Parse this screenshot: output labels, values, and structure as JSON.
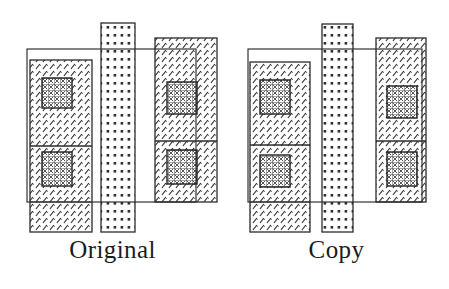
{
  "figure": {
    "title": "",
    "background_color": "#ffffff",
    "line_color": "#2b2b2b",
    "hatch_color": "#3a3a3a",
    "panels": [
      {
        "id": "original",
        "caption": "Original",
        "shapes": [
          {
            "name": "outline-rectangle",
            "x": 27,
            "y": 49,
            "w": 169,
            "h": 153,
            "fill": "none"
          },
          {
            "name": "left-hatched-column",
            "x": 30,
            "y": 60,
            "w": 62,
            "h": 172,
            "texture": "diagonal-slash"
          },
          {
            "name": "left-divider-line",
            "x1": 30,
            "y1": 146,
            "x2": 92,
            "y2": 146
          },
          {
            "name": "left-inner-crosshatch-box-upper",
            "x": 42,
            "y": 78,
            "w": 30,
            "h": 30,
            "texture": "cross-grid"
          },
          {
            "name": "left-inner-crosshatch-box-lower",
            "x": 42,
            "y": 152,
            "w": 30,
            "h": 34,
            "texture": "cross-grid"
          },
          {
            "name": "middle-dotted-column",
            "x": 101,
            "y": 23,
            "w": 34,
            "h": 209,
            "texture": "dot-grid"
          },
          {
            "name": "right-hatched-column",
            "x": 155,
            "y": 38,
            "w": 62,
            "h": 164,
            "texture": "diagonal-slash"
          },
          {
            "name": "right-divider-line",
            "x1": 155,
            "y1": 141,
            "x2": 217,
            "y2": 141
          },
          {
            "name": "right-inner-crosshatch-box-upper",
            "x": 167,
            "y": 82,
            "w": 30,
            "h": 32,
            "texture": "cross-grid"
          },
          {
            "name": "right-inner-crosshatch-box-lower",
            "x": 167,
            "y": 150,
            "w": 30,
            "h": 34,
            "texture": "cross-grid"
          }
        ]
      },
      {
        "id": "copy",
        "caption": "Copy",
        "shapes": [
          {
            "name": "outline-rectangle",
            "x": 24,
            "y": 49,
            "w": 174,
            "h": 153,
            "fill": "none"
          },
          {
            "name": "left-hatched-column",
            "x": 26,
            "y": 62,
            "w": 60,
            "h": 170,
            "texture": "diagonal-slash"
          },
          {
            "name": "left-divider-line",
            "x1": 26,
            "y1": 145,
            "x2": 86,
            "y2": 145
          },
          {
            "name": "left-inner-crosshatch-box-upper",
            "x": 36,
            "y": 80,
            "w": 30,
            "h": 34,
            "texture": "cross-grid"
          },
          {
            "name": "left-inner-crosshatch-box-lower",
            "x": 36,
            "y": 155,
            "w": 30,
            "h": 32,
            "texture": "cross-grid"
          },
          {
            "name": "middle-dotted-column",
            "x": 98,
            "y": 24,
            "w": 31,
            "h": 208,
            "texture": "dot-grid"
          },
          {
            "name": "right-hatched-column",
            "x": 152,
            "y": 38,
            "w": 50,
            "h": 164,
            "texture": "diagonal-slash"
          },
          {
            "name": "right-divider-line",
            "x1": 152,
            "y1": 141,
            "x2": 202,
            "y2": 141
          },
          {
            "name": "right-inner-crosshatch-box-upper",
            "x": 163,
            "y": 86,
            "w": 30,
            "h": 32,
            "texture": "cross-grid"
          },
          {
            "name": "right-inner-crosshatch-box-lower",
            "x": 163,
            "y": 152,
            "w": 30,
            "h": 34,
            "texture": "cross-grid"
          }
        ]
      }
    ]
  },
  "captions": {
    "left": "Original",
    "right": "Copy"
  }
}
